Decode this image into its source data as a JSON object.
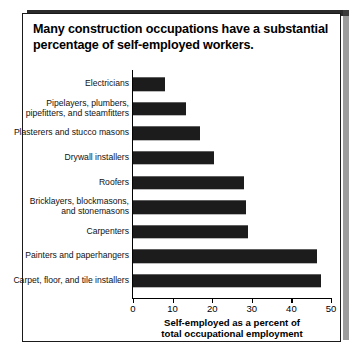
{
  "figure": {
    "title": "Many construction occupations have a substantial percentage of self-employed workers.",
    "title_line1": "Many construction occupations have a substantial",
    "title_line2": "percentage of self-employed workers.",
    "xlabel_line1": "Self-employed as a percent of",
    "xlabel_line2": "total occupational employment",
    "frame_color": "#1a1a1a",
    "bar_color": "#1c1c1c"
  },
  "chart_data": {
    "type": "bar",
    "orientation": "horizontal",
    "title": "Many construction occupations have a substantial percentage of self-employed workers.",
    "xlabel": "Self-employed as a percent of total occupational employment",
    "ylabel": "",
    "xlim": [
      0,
      50
    ],
    "xticks": [
      0,
      10,
      20,
      30,
      40,
      50
    ],
    "xtick_labels": [
      "0",
      "10",
      "20",
      "30",
      "40",
      "50"
    ],
    "grid": false,
    "legend": null,
    "categories": [
      "Electricians",
      "Pipelayers, plumbers, pipefitters, and steamfitters",
      "Plasterers and stucco masons",
      "Drywall installers",
      "Roofers",
      "Bricklayers, blockmasons, and stonemasons",
      "Carpenters",
      "Painters and paperhangers",
      "Carpet, floor, and tile installers"
    ],
    "category_lines": [
      [
        "Electricians"
      ],
      [
        "Pipelayers, plumbers,",
        "pipefitters, and steamfitters"
      ],
      [
        "Plasterers and stucco masons"
      ],
      [
        "Drywall installers"
      ],
      [
        "Roofers"
      ],
      [
        "Bricklayers, blockmasons,",
        "and stonemasons"
      ],
      [
        "Carpenters"
      ],
      [
        "Painters and paperhangers"
      ],
      [
        "Carpet, floor, and tile installers"
      ]
    ],
    "values": [
      8,
      13.5,
      17,
      20.5,
      28,
      28.5,
      29,
      46.5,
      47.5
    ]
  }
}
